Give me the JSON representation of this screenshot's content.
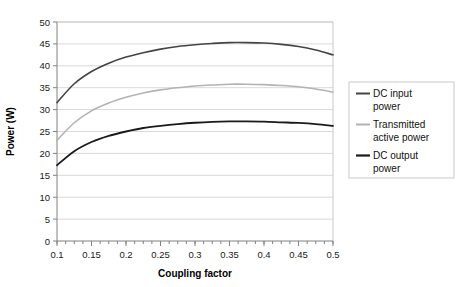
{
  "chart_data": {
    "type": "line",
    "title": "",
    "xlabel": "Coupling factor",
    "ylabel": "Power (W)",
    "xlim": [
      0.1,
      0.5
    ],
    "ylim": [
      0,
      50
    ],
    "grid": "horizontal",
    "legend_position": "right",
    "xticks": [
      "0.1",
      "0.15",
      "0.2",
      "0.25",
      "0.3",
      "0.35",
      "0.4",
      "0.45",
      "0.5"
    ],
    "xtick_values": [
      0.1,
      0.15,
      0.2,
      0.25,
      0.3,
      0.35,
      0.4,
      0.45,
      0.5
    ],
    "yticks": [
      "0",
      "5",
      "10",
      "15",
      "20",
      "25",
      "30",
      "35",
      "40",
      "45",
      "50"
    ],
    "ytick_values": [
      0,
      5,
      10,
      15,
      20,
      25,
      30,
      35,
      40,
      45,
      50
    ],
    "x": [
      0.1,
      0.125,
      0.15,
      0.175,
      0.2,
      0.225,
      0.25,
      0.275,
      0.3,
      0.325,
      0.35,
      0.375,
      0.4,
      0.425,
      0.45,
      0.475,
      0.5
    ],
    "series": [
      {
        "name": "DC input power",
        "color": "#444444",
        "width": 1.6,
        "values": [
          31.6,
          35.9,
          38.7,
          40.6,
          42.0,
          43.0,
          43.8,
          44.4,
          44.8,
          45.1,
          45.3,
          45.3,
          45.2,
          44.9,
          44.4,
          43.6,
          42.5
        ]
      },
      {
        "name": "Transmitted active power",
        "color": "#b3b3b3",
        "width": 1.6,
        "values": [
          23.0,
          27.0,
          29.7,
          31.5,
          32.8,
          33.8,
          34.5,
          35.0,
          35.4,
          35.6,
          35.8,
          35.8,
          35.7,
          35.5,
          35.2,
          34.7,
          34.0
        ]
      },
      {
        "name": "DC output power",
        "color": "#1a1a1a",
        "width": 1.8,
        "values": [
          17.3,
          20.5,
          22.6,
          24.0,
          25.0,
          25.8,
          26.3,
          26.7,
          27.0,
          27.2,
          27.3,
          27.3,
          27.25,
          27.1,
          26.95,
          26.7,
          26.3
        ]
      }
    ]
  },
  "legend": {
    "items": [
      {
        "label_line1": "DC input",
        "label_line2": "power"
      },
      {
        "label_line1": "Transmitted",
        "label_line2": "active power"
      },
      {
        "label_line1": "DC output",
        "label_line2": "power"
      }
    ]
  }
}
